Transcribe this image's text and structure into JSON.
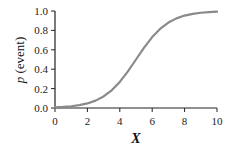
{
  "chart_data": {
    "type": "line",
    "title": "",
    "xlabel": "X",
    "ylabel": "p (event)",
    "ylabel_italic_part": "p",
    "ylabel_rest": " (event)",
    "xlim": [
      0,
      10
    ],
    "ylim": [
      0,
      1.0
    ],
    "x_ticks": [
      "0",
      "2",
      "4",
      "6",
      "8",
      "10"
    ],
    "y_ticks": [
      "0.0",
      "0.2",
      "0.4",
      "0.6",
      "0.8",
      "1.0"
    ],
    "grid": false,
    "legend": null,
    "series": [
      {
        "name": "logistic",
        "color": "#8a8a8a",
        "x": [
          0,
          0.5,
          1,
          1.5,
          2,
          2.5,
          3,
          3.5,
          4,
          4.5,
          5,
          5.5,
          6,
          6.5,
          7,
          7.5,
          8,
          8.5,
          9,
          9.5,
          10
        ],
        "values": [
          0.007,
          0.011,
          0.018,
          0.029,
          0.047,
          0.076,
          0.119,
          0.182,
          0.269,
          0.378,
          0.5,
          0.622,
          0.731,
          0.818,
          0.881,
          0.924,
          0.953,
          0.971,
          0.982,
          0.989,
          0.993
        ]
      }
    ]
  },
  "colors": {
    "axis": "#222222",
    "curve": "#8a8a8a",
    "background": "#ffffff"
  }
}
